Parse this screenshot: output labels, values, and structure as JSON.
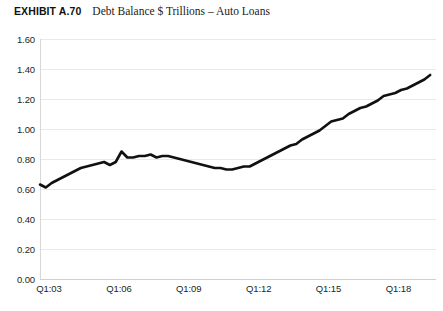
{
  "header": {
    "exhibit_label": "EXHIBIT A.70",
    "exhibit_title": "Debt Balance $ Trillions – Auto Loans"
  },
  "chart_data": {
    "type": "line",
    "title": "Debt Balance $ Trillions – Auto Loans",
    "exhibit": "EXHIBIT A.70",
    "xlabel": "",
    "ylabel": "",
    "ylim": [
      0.0,
      1.6
    ],
    "ytick_labels": [
      "1.60",
      "1.40",
      "1.20",
      "1.00",
      "0.80",
      "0.60",
      "0.40",
      "0.20",
      "0.00"
    ],
    "ytick_values": [
      1.6,
      1.4,
      1.2,
      1.0,
      0.8,
      0.6,
      0.4,
      0.2,
      0.0
    ],
    "xtick_labels": [
      "Q1:03",
      "Q1:06",
      "Q1:09",
      "Q1:12",
      "Q1:15",
      "Q1:18"
    ],
    "xtick_positions": [
      0,
      12,
      24,
      36,
      48,
      60
    ],
    "grid": true,
    "legend": "none",
    "line_color": "#111111",
    "line_width": 2.6,
    "x": [
      0,
      1,
      2,
      3,
      4,
      5,
      6,
      7,
      8,
      9,
      10,
      11,
      12,
      13,
      14,
      15,
      16,
      17,
      18,
      19,
      20,
      21,
      22,
      23,
      24,
      25,
      26,
      27,
      28,
      29,
      30,
      31,
      32,
      33,
      34,
      35,
      36,
      37,
      38,
      39,
      40,
      41,
      42,
      43,
      44,
      45,
      46,
      47,
      48,
      49,
      50,
      51,
      52,
      53,
      54,
      55,
      56,
      57,
      58,
      59,
      60,
      61,
      62,
      63,
      64,
      65,
      66,
      67
    ],
    "x_quarter_labels": [
      "Q1:03",
      "Q2:03",
      "Q3:03",
      "Q4:03",
      "Q1:04",
      "Q2:04",
      "Q3:04",
      "Q4:04",
      "Q1:05",
      "Q2:05",
      "Q3:05",
      "Q4:05",
      "Q1:06",
      "Q2:06",
      "Q3:06",
      "Q4:06",
      "Q1:07",
      "Q2:07",
      "Q3:07",
      "Q4:07",
      "Q1:08",
      "Q2:08",
      "Q3:08",
      "Q4:08",
      "Q1:09",
      "Q2:09",
      "Q3:09",
      "Q4:09",
      "Q1:10",
      "Q2:10",
      "Q3:10",
      "Q4:10",
      "Q1:11",
      "Q2:11",
      "Q3:11",
      "Q4:11",
      "Q1:12",
      "Q2:12",
      "Q3:12",
      "Q4:12",
      "Q1:13",
      "Q2:13",
      "Q3:13",
      "Q4:13",
      "Q1:14",
      "Q2:14",
      "Q3:14",
      "Q4:14",
      "Q1:15",
      "Q2:15",
      "Q3:15",
      "Q4:15",
      "Q1:16",
      "Q2:16",
      "Q3:16",
      "Q4:16",
      "Q1:17",
      "Q2:17",
      "Q3:17",
      "Q4:17",
      "Q1:18",
      "Q2:18",
      "Q3:18",
      "Q4:18",
      "Q1:19",
      "Q2:19",
      "Q3:19",
      "Q4:19"
    ],
    "values": [
      0.63,
      0.61,
      0.64,
      0.66,
      0.68,
      0.7,
      0.72,
      0.74,
      0.75,
      0.76,
      0.77,
      0.78,
      0.76,
      0.78,
      0.85,
      0.81,
      0.81,
      0.82,
      0.82,
      0.83,
      0.81,
      0.82,
      0.82,
      0.81,
      0.8,
      0.79,
      0.78,
      0.77,
      0.76,
      0.75,
      0.74,
      0.74,
      0.73,
      0.73,
      0.74,
      0.75,
      0.75,
      0.77,
      0.79,
      0.81,
      0.83,
      0.85,
      0.87,
      0.89,
      0.9,
      0.93,
      0.95,
      0.97,
      0.99,
      1.02,
      1.05,
      1.06,
      1.07,
      1.1,
      1.12,
      1.14,
      1.15,
      1.17,
      1.19,
      1.22,
      1.23,
      1.24,
      1.26,
      1.27,
      1.29,
      1.31,
      1.33,
      1.36
    ]
  }
}
